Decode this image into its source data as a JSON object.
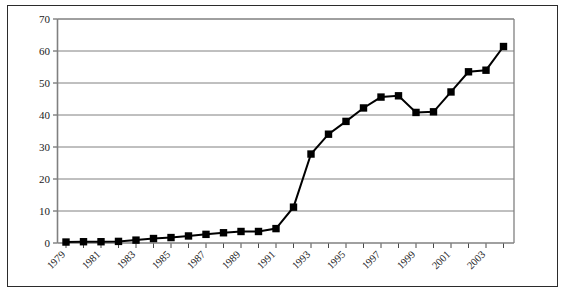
{
  "chart_data": {
    "type": "line",
    "title": "",
    "subtitle": "",
    "xlabel": "",
    "ylabel": "",
    "legend": [],
    "legend_position": "none",
    "grid": "horizontal",
    "xlim": [
      1979,
      2004
    ],
    "ylim": [
      0,
      70
    ],
    "ytick_values": [
      0,
      10,
      20,
      30,
      40,
      50,
      60,
      70
    ],
    "ytick_labels": [
      "0",
      "10",
      "20",
      "30",
      "40",
      "50",
      "60",
      "70"
    ],
    "xtick_values": [
      1979,
      1980,
      1981,
      1982,
      1983,
      1984,
      1985,
      1986,
      1987,
      1988,
      1989,
      1990,
      1991,
      1992,
      1993,
      1994,
      1995,
      1996,
      1997,
      1998,
      1999,
      2000,
      2001,
      2002,
      2003,
      2004
    ],
    "xtick_labels_shown": [
      "1979",
      "1981",
      "1983",
      "1985",
      "1987",
      "1989",
      "1991",
      "1993",
      "1995",
      "1997",
      "1999",
      "2001",
      "2003"
    ],
    "x": [
      1979,
      1980,
      1981,
      1982,
      1983,
      1984,
      1985,
      1986,
      1987,
      1988,
      1989,
      1990,
      1991,
      1992,
      1993,
      1994,
      1995,
      1996,
      1997,
      1998,
      1999,
      2000,
      2001,
      2002,
      2003,
      2004
    ],
    "values": [
      0.3,
      0.4,
      0.4,
      0.5,
      0.9,
      1.4,
      1.7,
      2.2,
      2.7,
      3.2,
      3.6,
      3.6,
      4.5,
      11.2,
      27.8,
      34.0,
      38.0,
      42.2,
      45.6,
      46.0,
      40.8,
      41.0,
      47.2,
      53.5,
      54.0,
      61.4
    ],
    "marker": "square",
    "marker_color": "#000000",
    "line_color": "#000000",
    "line_width": 2,
    "gridline_color": "#808080",
    "axis_color": "#808080",
    "frame_color": "#2b2b2b"
  },
  "figure": {
    "background": "#ffffff",
    "border_color": "#2b2b2b"
  }
}
